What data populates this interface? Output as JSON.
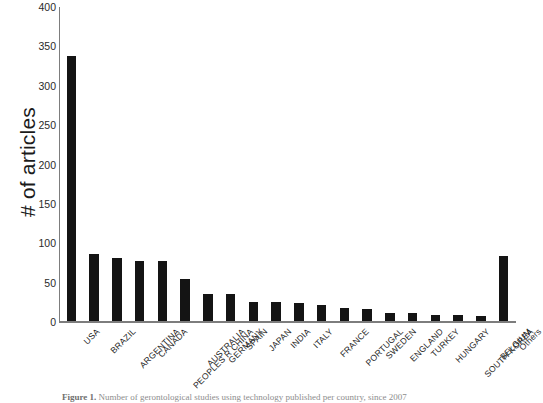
{
  "chart_data": {
    "type": "bar",
    "title": "",
    "xlabel": "",
    "ylabel": "# of articles",
    "ylim": [
      0,
      400
    ],
    "yticks": [
      400,
      350,
      300,
      250,
      200,
      150,
      100,
      50,
      0
    ],
    "grid": false,
    "legend": "none",
    "bar_color": "#141414",
    "axis_color": "#7d7d7d",
    "categories": [
      "USA",
      "BRAZIL",
      "ARGENTINA",
      "CANADA",
      "PEOPLES R CHINA",
      "AUSTRALIA",
      "GERMANY",
      "SPAIN",
      "JAPAN",
      "INDIA",
      "ITALY",
      "FRANCE",
      "PORTUGAL",
      "SWEDEN",
      "ENGLAND",
      "TURKEY",
      "HUNGARY",
      "SOUTH KOREA",
      "BELGIUM",
      "Others"
    ],
    "values": [
      338,
      86,
      81,
      78,
      77,
      54,
      36,
      35,
      26,
      25,
      24,
      22,
      18,
      16,
      12,
      12,
      9,
      9,
      8,
      84
    ]
  },
  "caption": {
    "label": "Figure 1.",
    "text": "Number of gerontological studies using technology published per country, since 2007"
  }
}
